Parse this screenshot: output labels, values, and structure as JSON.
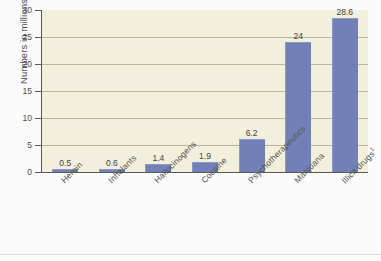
{
  "chart_data": {
    "type": "bar",
    "title": "",
    "xlabel": "",
    "ylabel": "Numbers in millions",
    "ylim": [
      0,
      30
    ],
    "ytick_values": [
      30,
      25,
      20,
      15,
      10,
      5,
      0
    ],
    "ytick_labels": [
      "30",
      "25",
      "20",
      "15",
      "10",
      "5",
      "0"
    ],
    "grid": true,
    "legend": "none",
    "bar_color": "#7181b8",
    "plot_background": "#f2f0dc",
    "categories": [
      "Heroin",
      "Inhalants",
      "Hallucinogens",
      "Cocaine",
      "Psychotherapeutics",
      "Marijuana",
      "Illicit drugs"
    ],
    "category_footnotes": [
      "",
      "",
      "",
      "",
      "",
      "",
      "1"
    ],
    "values": [
      0.5,
      0.6,
      1.4,
      1.9,
      6.2,
      24,
      28.6
    ],
    "value_labels": [
      "0.5",
      "0.6",
      "1.4",
      "1.9",
      "6.2",
      "24",
      "28.6"
    ]
  }
}
